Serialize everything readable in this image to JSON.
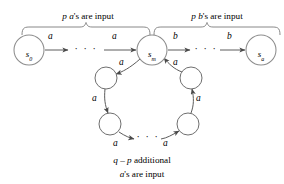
{
  "figure": {
    "type": "finite-state-machine-diagram",
    "background_color": "#ffffff",
    "stroke_color": "#5c5c5c",
    "text_color": "#1c1c1c"
  },
  "annotations": {
    "top_left_brace_label": {
      "prefix_italic": "p a",
      "suffix": "'s are input",
      "full": "p a's are input"
    },
    "top_right_brace_label": {
      "prefix_italic": "p b",
      "suffix": "'s are input",
      "full": "p b's are input"
    },
    "bottom_caption_line1": {
      "italic_part": "q – p",
      "roman_part": " additional",
      "full": "q – p additional"
    },
    "bottom_caption_line2": {
      "italic_part": "a",
      "roman_part": "'s are input",
      "full": "a's are input"
    }
  },
  "states": {
    "start": {
      "name": "s-0",
      "base": "s",
      "subscript": "0",
      "cx": 29,
      "cy": 50,
      "r": 15
    },
    "middle": {
      "name": "s-m",
      "base": "s",
      "subscript": "m",
      "cx": 152,
      "cy": 50,
      "r": 15
    },
    "end": {
      "name": "s-n",
      "base": "s",
      "subscript": "a",
      "cx": 261,
      "cy": 50,
      "r": 15
    }
  },
  "loop_nodes": [
    {
      "name": "loop-node-upper-left",
      "cx": 107,
      "cy": 78,
      "r": 11
    },
    {
      "name": "loop-node-upper-right",
      "cx": 189,
      "cy": 78,
      "r": 11
    },
    {
      "name": "loop-node-lower-left",
      "cx": 110,
      "cy": 124,
      "r": 11
    },
    {
      "name": "loop-node-lower-right",
      "cx": 187,
      "cy": 124,
      "r": 11
    }
  ],
  "edges": [
    {
      "name": "edge-s0-to-dots",
      "label": "a",
      "from": "s-0",
      "to": "ellipsis-left"
    },
    {
      "name": "edge-dots-to-sm",
      "label": "a",
      "from": "ellipsis-left",
      "to": "s-m"
    },
    {
      "name": "edge-sm-to-dots",
      "label": "b",
      "from": "s-m",
      "to": "ellipsis-right"
    },
    {
      "name": "edge-dots-to-sn",
      "label": "b",
      "from": "ellipsis-right",
      "to": "s-n"
    },
    {
      "name": "edge-sm-to-loop-upper-left",
      "label": "a",
      "from": "s-m",
      "to": "loop-node-upper-left"
    },
    {
      "name": "edge-loop-upper-left-to-lower-left",
      "label": "a",
      "from": "loop-node-upper-left",
      "to": "loop-node-lower-left"
    },
    {
      "name": "edge-loop-lower-left-to-dots",
      "label": "a",
      "from": "loop-node-lower-left",
      "to": "ellipsis-bottom"
    },
    {
      "name": "edge-loop-dots-to-lower-right",
      "label": "a",
      "from": "ellipsis-bottom",
      "to": "loop-node-lower-right"
    },
    {
      "name": "edge-loop-lower-right-to-upper-right",
      "label": "a",
      "from": "loop-node-lower-right",
      "to": "loop-node-upper-right"
    },
    {
      "name": "edge-loop-upper-right-to-sm",
      "label": "a",
      "from": "loop-node-upper-right",
      "to": "s-m"
    }
  ],
  "ellipses": {
    "left": {
      "name": "ellipsis-left",
      "glyph": "· · ·"
    },
    "right": {
      "name": "ellipsis-right",
      "glyph": "· · ·"
    },
    "bottom": {
      "name": "ellipsis-bottom",
      "glyph": "· · ·"
    }
  }
}
